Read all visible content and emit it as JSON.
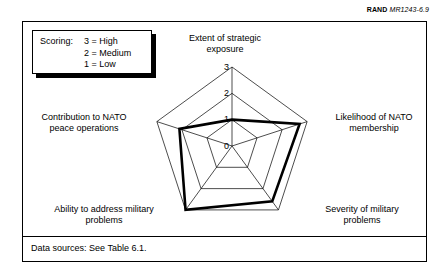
{
  "figure": {
    "source_credit": {
      "org": "RAND",
      "code": "MR1243-6.9"
    },
    "footer_note": "Data sources:  See Table 6.1."
  },
  "scoring_legend": {
    "title": "Scoring:",
    "rows": [
      {
        "label": "",
        "value": "3 = High"
      },
      {
        "label": "",
        "value": "2 = Medium"
      },
      {
        "label": "",
        "value": "1 = Low"
      }
    ]
  },
  "chart_data": {
    "type": "radar",
    "title": "",
    "subtitle": "",
    "categories": [
      "Extent of strategic exposure",
      "Likelihood of NATO membership",
      "Severity of military problems",
      "Ability to address military problems",
      "Contribution to NATO peace operations"
    ],
    "category_label_lines": [
      [
        "Extent of strategic",
        "exposure"
      ],
      [
        "Likelihood of NATO",
        "membership"
      ],
      [
        "Severity of military",
        "problems"
      ],
      [
        "Ability to address military",
        "problems"
      ],
      [
        "Contribution to NATO",
        "peace operations"
      ]
    ],
    "series": [
      {
        "name": "Score",
        "values": [
          1.0,
          2.7,
          2.6,
          3.0,
          2.1
        ]
      }
    ],
    "rlim": [
      0,
      3
    ],
    "tick_values": [
      0,
      1,
      2,
      3
    ],
    "tick_labels": [
      "0",
      "1",
      "2",
      "3"
    ],
    "grid": true,
    "grid_shape": "polygon",
    "legend_position": "none",
    "scale_meaning": {
      "3": "High",
      "2": "Medium",
      "1": "Low"
    },
    "colors": {
      "grid": "#000000",
      "series": "#000000",
      "background": "#ffffff"
    }
  }
}
